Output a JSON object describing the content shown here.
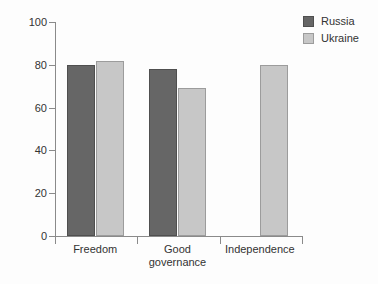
{
  "chart_data": {
    "type": "bar",
    "categories": [
      "Freedom",
      "Good governance",
      "Independence"
    ],
    "series": [
      {
        "name": "Russia",
        "color": "#666666",
        "border_color": "#4f4f4f",
        "values": [
          80,
          78,
          null
        ]
      },
      {
        "name": "Ukraine",
        "color": "#c7c7c7",
        "border_color": "#9c9c9c",
        "values": [
          82,
          69,
          80
        ]
      }
    ],
    "ylim": [
      0,
      100
    ],
    "yticks": [
      0,
      20,
      40,
      60,
      80,
      100
    ],
    "grid": false,
    "legend_position": "top-right"
  },
  "colors": {
    "axis": "#8a8a8a",
    "text": "#333333",
    "background": "#fdfdfd"
  }
}
